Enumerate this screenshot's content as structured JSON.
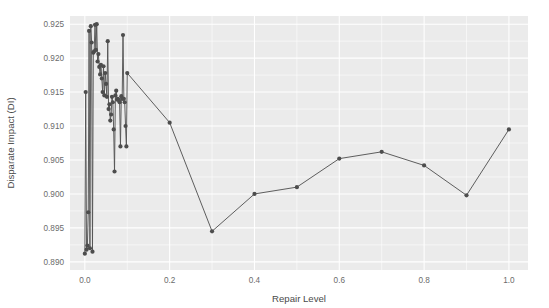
{
  "chart_data": {
    "type": "line",
    "title": "",
    "xlabel": "Repair Level",
    "ylabel": "Disparate Impact (DI)",
    "xlim": [
      -0.035,
      1.045
    ],
    "ylim": [
      0.8888,
      0.9262
    ],
    "grid": true,
    "legend": "none",
    "xticks": [
      0.0,
      0.2,
      0.4,
      0.6,
      0.8,
      1.0
    ],
    "xticklabels": [
      "0.0",
      "0.2",
      "0.4",
      "0.6",
      "0.8",
      "1.0"
    ],
    "yticks": [
      0.89,
      0.895,
      0.9,
      0.905,
      0.91,
      0.915,
      0.92,
      0.925
    ],
    "yticklabels": [
      "0.890",
      "0.895",
      "0.900",
      "0.905",
      "0.910",
      "0.915",
      "0.920",
      "0.925"
    ],
    "marker": "circle",
    "marker_color": "#4d4d4d",
    "line_color": "#555555",
    "panel_color": "#ebebeb",
    "grid_color": "#ffffff",
    "series": [
      {
        "name": "Disparate Impact",
        "x": [
          0.0,
          0.002,
          0.004,
          0.006,
          0.008,
          0.01,
          0.012,
          0.014,
          0.016,
          0.018,
          0.02,
          0.022,
          0.024,
          0.026,
          0.028,
          0.03,
          0.032,
          0.034,
          0.036,
          0.038,
          0.04,
          0.042,
          0.044,
          0.046,
          0.048,
          0.05,
          0.052,
          0.054,
          0.056,
          0.058,
          0.06,
          0.062,
          0.064,
          0.066,
          0.068,
          0.07,
          0.072,
          0.074,
          0.076,
          0.078,
          0.08,
          0.082,
          0.084,
          0.086,
          0.088,
          0.09,
          0.092,
          0.094,
          0.096,
          0.098,
          0.1,
          0.2,
          0.3,
          0.4,
          0.5,
          0.6,
          0.7,
          0.8,
          0.9,
          1.0
        ],
        "y": [
          0.8912,
          0.915,
          0.8918,
          0.8924,
          0.8973,
          0.924,
          0.892,
          0.9247,
          0.9223,
          0.8915,
          0.9208,
          0.921,
          0.9249,
          0.9212,
          0.925,
          0.9195,
          0.9206,
          0.9187,
          0.9176,
          0.919,
          0.917,
          0.915,
          0.9188,
          0.9145,
          0.9178,
          0.9162,
          0.9143,
          0.9225,
          0.9125,
          0.9132,
          0.9108,
          0.9117,
          0.9143,
          0.9135,
          0.9095,
          0.9033,
          0.9145,
          0.9152,
          0.9139,
          0.914,
          0.9138,
          0.9135,
          0.907,
          0.9144,
          0.914,
          0.9234,
          0.914,
          0.9135,
          0.91,
          0.907,
          0.9178,
          0.9105,
          0.8945,
          0.9,
          0.901,
          0.9052,
          0.9062,
          0.9042,
          0.8998,
          0.9095
        ]
      }
    ]
  },
  "axes": {
    "x_title": "Repair Level",
    "y_title": "Disparate Impact (DI)"
  }
}
